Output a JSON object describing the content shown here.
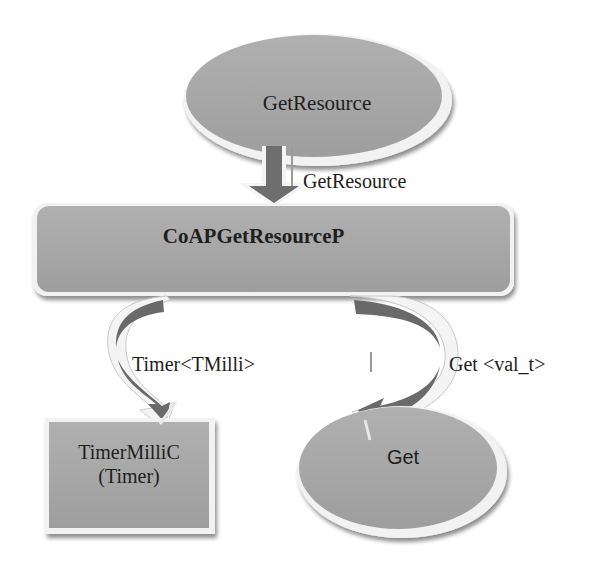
{
  "diagram": {
    "type": "component-wiring",
    "nodes": {
      "top": {
        "label": "GetResource",
        "shape": "ellipse"
      },
      "main": {
        "label": "CoAPGetResourceP",
        "shape": "rounded-rectangle"
      },
      "timer": {
        "line1": "TimerMilliC",
        "line2": "(Timer)",
        "shape": "rectangle"
      },
      "get": {
        "label": "Get",
        "shape": "ellipse"
      }
    },
    "edges": {
      "top_to_main": {
        "label": "GetResource",
        "arrow": "straight-down"
      },
      "main_to_timer": {
        "label": "Timer<TMilli>",
        "arrow": "curved-left"
      },
      "main_to_get": {
        "label": "Get <val_t>",
        "arrow": "curved-right"
      }
    },
    "colors": {
      "fill": "#a6a6a6",
      "arrow_fill": "#6e6e6e",
      "highlight": "#f4f4f4",
      "shadow": "#8c8c8c",
      "text": "#1e1e1e",
      "background": "#ffffff"
    }
  }
}
